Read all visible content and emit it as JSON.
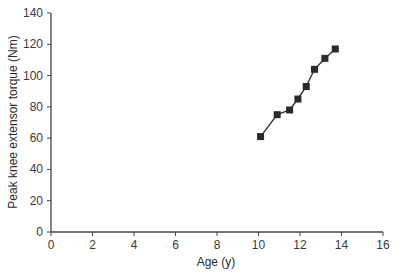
{
  "chart_data": {
    "type": "line",
    "title": "",
    "xlabel": "Age (y)",
    "ylabel": "Peak knee extensor torque (Nm)",
    "xlim": [
      0,
      16
    ],
    "ylim": [
      0,
      140
    ],
    "xticks": [
      0,
      2,
      4,
      6,
      8,
      10,
      12,
      14,
      16
    ],
    "yticks": [
      0,
      20,
      40,
      60,
      80,
      100,
      120,
      140
    ],
    "grid": false,
    "legend": null,
    "marker": "square",
    "series": [
      {
        "name": "Peak knee extensor torque",
        "x": [
          10.1,
          10.9,
          11.5,
          11.9,
          12.3,
          12.7,
          13.2,
          13.7
        ],
        "y": [
          61,
          75,
          78,
          85,
          93,
          104,
          111,
          117
        ]
      }
    ],
    "colors": {
      "line": "#333333",
      "marker": "#2a2a2a",
      "axis": "#444444"
    }
  }
}
